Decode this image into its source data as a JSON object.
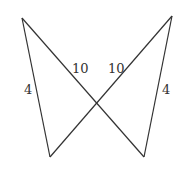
{
  "diagram": {
    "title": "",
    "vertices": {
      "top_left": [
        22,
        18
      ],
      "top_right": [
        172,
        16
      ],
      "bottom_left": [
        50,
        157
      ],
      "bottom_right": [
        144,
        157
      ],
      "intersection": [
        97,
        104
      ]
    },
    "segments": [
      {
        "from": "top_left",
        "to": "bottom_left",
        "label": "4"
      },
      {
        "from": "top_left",
        "to": "bottom_right",
        "label": "10"
      },
      {
        "from": "top_right",
        "to": "bottom_left",
        "label": "10"
      },
      {
        "from": "top_right",
        "to": "bottom_right",
        "label": "4"
      }
    ],
    "labels": {
      "left_side": "4",
      "right_side": "4",
      "left_diagonal": "10",
      "right_diagonal": "10"
    },
    "stroke_color": "#333333"
  }
}
